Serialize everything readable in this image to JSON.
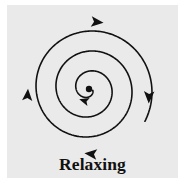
{
  "figure": {
    "caption": "Relaxing",
    "panel_background": "#ebeaea",
    "page_background": "#ffffff",
    "stroke_color": "#111111",
    "canvas": {
      "width": 185,
      "height": 194
    }
  },
  "chart_data": {
    "type": "line",
    "title": "Relaxing",
    "subtitle": "",
    "xlabel": "",
    "ylabel": "",
    "legend": [],
    "grid": false,
    "spiral": {
      "curve": "archimedean",
      "center": {
        "x": 89,
        "y": 89
      },
      "turns": 3,
      "inner_radius": 4,
      "outer_radius": 64,
      "growth_per_turn": 20,
      "direction": "clockwise",
      "growth": "outward",
      "stroke_width": 1.6,
      "start_angle_deg": 20,
      "end_angle_deg": 1110
    },
    "center_dot": {
      "x": 89,
      "y": 89,
      "radius": 3.2,
      "fill": "#111111"
    },
    "arrowheads": [
      {
        "name": "inner-arrow",
        "x": 85,
        "y": 101,
        "angle_deg": 196,
        "size": 5.2
      },
      {
        "name": "left-arrow",
        "x": 27.5,
        "y": 96,
        "angle_deg": 274,
        "size": 6.4
      },
      {
        "name": "top-arrow",
        "x": 96,
        "y": 22,
        "angle_deg": 6,
        "size": 6.6
      },
      {
        "name": "right-arrow",
        "x": 149,
        "y": 96,
        "angle_deg": 92,
        "size": 6.6
      },
      {
        "name": "bottom-arrow",
        "x": 92,
        "y": 154,
        "angle_deg": 186,
        "size": 6.6
      }
    ]
  }
}
